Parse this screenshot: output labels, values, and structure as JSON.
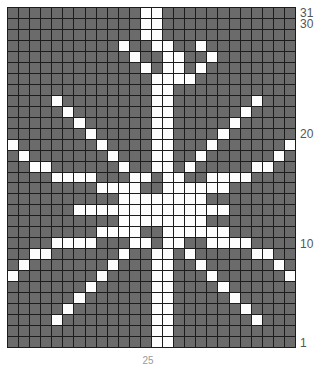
{
  "chart": {
    "columns": 26,
    "rows": 31,
    "colors": {
      "background_stitch": "#6b6b6b",
      "foreground_stitch": "#fdfdfd",
      "gridline": "#1c1c1c",
      "label_text": "#555555"
    },
    "row_labels": [
      {
        "text": "31",
        "row": 31
      },
      {
        "text": "30",
        "row": 30
      },
      {
        "text": "20",
        "row": 20
      },
      {
        "text": "10",
        "row": 10
      },
      {
        "text": "1",
        "row": 1
      }
    ],
    "bottom_label": "25"
  },
  "chart_data": {
    "type": "heatmap",
    "xlabel": "",
    "ylabel": "",
    "legend": [
      "background stitch",
      "contrast stitch"
    ],
    "columns": 26,
    "rows": 31,
    "value_colors": {
      "0": "#6b6b6b",
      "1": "#fdfdfd"
    },
    "row_order": "top row is chart row 31, bottom row is chart row 1",
    "grid": [
      "0000000000001100000000000",
      "0000000000001100000000000",
      "0000000000001100000000000",
      "00000000001001100100000000",
      "00000000000100110010000000",
      "00000000000010110100000000",
      "00000000000001111000000000",
      "00000000000001100000000000",
      "00001000000001100000001000",
      "00000100000001100000010000",
      "00000010000001100000100000",
      "00000001000001100001000000",
      "10000000100001100010000001",
      "01000000010001100100000010",
      "00110000001001101000001100",
      "00001111000110110011110000",
      "00000000111100111111000000",
      "00000000001111111100000000",
      "00000011111111111111000000",
      "00000000001111111100000000",
      "00000000111100111111000000",
      "00001111000110110011110000",
      "00110000001001101000001100",
      "01000000010001100100000010",
      "10000000100001100010000001",
      "00000001000001100001000000",
      "00000010000001100000100000",
      "00000100000001100000010000",
      "00001000000001100000001000",
      "00000000000001100000000000",
      "00000000000001100000000000"
    ]
  }
}
